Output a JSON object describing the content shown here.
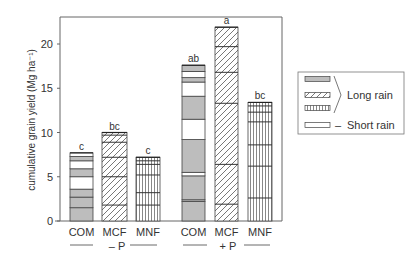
{
  "chart_data": {
    "type": "bar",
    "subtype": "stacked",
    "title": "",
    "xlabel": "",
    "ylabel": "cumulative grain yield (Mg ha⁻¹)",
    "ylim": [
      0,
      23
    ],
    "yticks": [
      0,
      5,
      10,
      15,
      20
    ],
    "grid": false,
    "legend_position": "right",
    "groups": [
      {
        "label": "– P",
        "categories": [
          "COM",
          "MCF",
          "MNF"
        ]
      },
      {
        "label": "+ P",
        "categories": [
          "COM",
          "MCF",
          "MNF"
        ]
      }
    ],
    "bars": [
      {
        "group": "– P",
        "category": "COM",
        "total": 7.7,
        "significance": "c",
        "pattern": "gray",
        "segments": [
          {
            "from": 0.0,
            "to": 1.5,
            "season": "long"
          },
          {
            "from": 1.5,
            "to": 2.7,
            "season": "long"
          },
          {
            "from": 2.7,
            "to": 3.6,
            "season": "long"
          },
          {
            "from": 3.6,
            "to": 5.0,
            "season": "short"
          },
          {
            "from": 5.0,
            "to": 5.9,
            "season": "long"
          },
          {
            "from": 5.9,
            "to": 6.8,
            "season": "short"
          },
          {
            "from": 6.8,
            "to": 7.3,
            "season": "long"
          },
          {
            "from": 7.3,
            "to": 7.7,
            "season": "short"
          }
        ]
      },
      {
        "group": "– P",
        "category": "MCF",
        "total": 10.0,
        "significance": "bc",
        "pattern": "hatched",
        "boundaries": [
          1.8,
          5.0,
          7.2,
          8.9,
          9.7
        ]
      },
      {
        "group": "– P",
        "category": "MNF",
        "total": 7.2,
        "significance": "c",
        "pattern": "vertical",
        "boundaries": [
          1.8,
          3.2,
          5.2,
          6.4,
          6.8
        ]
      },
      {
        "group": "+ P",
        "category": "COM",
        "total": 17.6,
        "significance": "ab",
        "pattern": "gray",
        "segments": [
          {
            "from": 0.0,
            "to": 2.2,
            "season": "long"
          },
          {
            "from": 2.2,
            "to": 2.4,
            "season": "long"
          },
          {
            "from": 2.4,
            "to": 5.1,
            "season": "long"
          },
          {
            "from": 5.1,
            "to": 5.5,
            "season": "short"
          },
          {
            "from": 5.5,
            "to": 9.2,
            "season": "long"
          },
          {
            "from": 9.2,
            "to": 11.5,
            "season": "short"
          },
          {
            "from": 11.5,
            "to": 14.1,
            "season": "long"
          },
          {
            "from": 14.1,
            "to": 15.7,
            "season": "short"
          },
          {
            "from": 15.7,
            "to": 16.2,
            "season": "long"
          },
          {
            "from": 16.2,
            "to": 16.9,
            "season": "short"
          },
          {
            "from": 16.9,
            "to": 17.6,
            "season": "long"
          }
        ]
      },
      {
        "group": "+ P",
        "category": "MCF",
        "total": 21.9,
        "significance": "a",
        "pattern": "hatched",
        "boundaries": [
          1.9,
          6.4,
          13.3,
          16.8,
          19.7
        ]
      },
      {
        "group": "+ P",
        "category": "MNF",
        "total": 13.4,
        "significance": "bc",
        "pattern": "vertical",
        "boundaries": [
          2.6,
          6.2,
          8.6,
          11.2,
          12.3,
          13.0
        ]
      }
    ],
    "legend": {
      "entries": [
        {
          "pattern": "gray",
          "label": "Long rain"
        },
        {
          "pattern": "hatched",
          "label": "Long rain"
        },
        {
          "pattern": "vertical",
          "label": "Long rain"
        },
        {
          "pattern": "white",
          "label": "Short rain"
        }
      ],
      "long_rain_label": "Long rain",
      "short_rain_label": "Short rain",
      "short_rain_dash": "–"
    },
    "colors": {
      "gray_fill": "#bdbdbd",
      "line": "#444444",
      "axis": "#555555"
    }
  }
}
